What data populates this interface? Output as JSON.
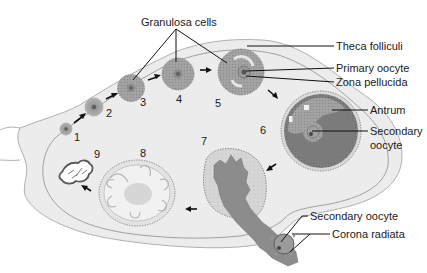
{
  "figure": {
    "colors": {
      "background": "#ffffff",
      "ovary_fill": "#ececec",
      "ovary_outline": "#9a9a9a",
      "follicle_gray": "#8f8f8f",
      "granulosa_gray": "#a6a6a6",
      "antrum_gray": "#7d7d7d",
      "corpus_luteum": "#cfcfcf",
      "oocyte_core": "#555555",
      "text": "#1a1a1a"
    },
    "stages": [
      {
        "number": "1",
        "description": "primordial follicle"
      },
      {
        "number": "2",
        "description": "primary follicle"
      },
      {
        "number": "3",
        "description": "primary follicle with granulosa cells"
      },
      {
        "number": "4",
        "description": "growing follicle"
      },
      {
        "number": "5",
        "description": "secondary follicle"
      },
      {
        "number": "6",
        "description": "mature (Graafian) follicle"
      },
      {
        "number": "7",
        "description": "ovulation / ruptured follicle"
      },
      {
        "number": "8",
        "description": "corpus luteum"
      },
      {
        "number": "9",
        "description": "corpus albicans"
      }
    ],
    "labels": {
      "granulosa": "Granulosa cells",
      "theca": "Theca folliculi",
      "primary_oocyte": "Primary oocyte",
      "zona": "Zona pellucida",
      "antrum": "Antrum",
      "secondary_oocyte_line1": "Secondary",
      "secondary_oocyte_line2": "oocyte",
      "ovulated_oocyte": "Secondary oocyte",
      "corona": "Corona radiata"
    }
  }
}
